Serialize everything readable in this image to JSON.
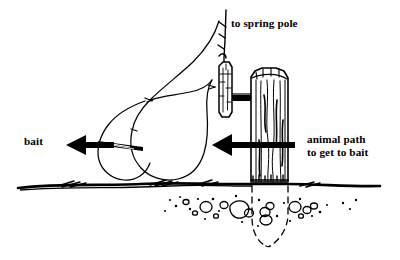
{
  "diagram": {
    "style": "black and white pen line art",
    "background_color": "#ffffff",
    "ink_color": "#000000",
    "labels": {
      "spring_pole": "to spring pole",
      "bait": "bait",
      "animal_path_line1": "animal path",
      "animal_path_line2": "to get to bait"
    },
    "parts": [
      {
        "name": "spring-pole-cord",
        "description": "vertical cord rising to the spring pole"
      },
      {
        "name": "toggle-stick",
        "description": "hanging trigger toggle stick"
      },
      {
        "name": "cross-peg",
        "description": "short horizontal peg joining toggle to post"
      },
      {
        "name": "post",
        "description": "driven wooden post with vertical wood grain"
      },
      {
        "name": "snare-loop-large",
        "description": "large teardrop snare loop"
      },
      {
        "name": "snare-loop-small",
        "description": "smaller teardrop snare loop near bait"
      },
      {
        "name": "bait-stick",
        "description": "small elongated bait sliver on the ground line"
      },
      {
        "name": "ground-line",
        "description": "thick irregular ground surface stroke with grass tufts"
      },
      {
        "name": "buried-post-outline",
        "description": "dashed outline of the tapered buried post end"
      },
      {
        "name": "pebbles",
        "description": "scattered subsurface pebbles and grit"
      }
    ],
    "arrows": [
      {
        "name": "bait-arrow",
        "direction": "left",
        "label": "bait"
      },
      {
        "name": "animal-path-arrow",
        "direction": "left",
        "label": "animal path to get to bait"
      }
    ]
  }
}
